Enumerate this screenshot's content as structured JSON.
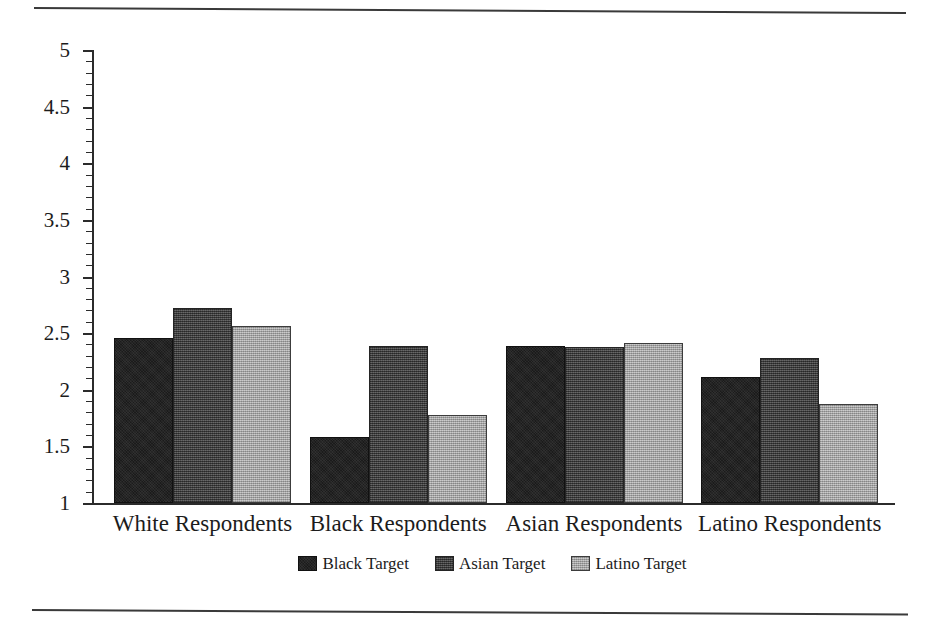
{
  "chart_data": {
    "type": "bar",
    "title": "",
    "subtitle": "",
    "xlabel": "",
    "ylabel": "",
    "ylim": [
      1,
      5
    ],
    "ytick_labels": [
      "1",
      "1.5",
      "2",
      "2.5",
      "3",
      "3.5",
      "4",
      "4.5",
      "5"
    ],
    "ytick_values": [
      1,
      1.5,
      2,
      2.5,
      3,
      3.5,
      4,
      4.5,
      5
    ],
    "minor_tick_step": 0.1,
    "grid": false,
    "legend_position": "bottom-center",
    "categories": [
      "White Respondents",
      "Black Respondents",
      "Asian Respondents",
      "Latino Respondents"
    ],
    "series": [
      {
        "name": "Black Target",
        "color": "#1b1b1b",
        "values": [
          2.46,
          1.58,
          2.39,
          2.11
        ]
      },
      {
        "name": "Asian Target",
        "color": "#4c4c4c",
        "values": [
          2.72,
          2.39,
          2.38,
          2.28
        ]
      },
      {
        "name": "Latino Target",
        "color": "#b2b2b2",
        "values": [
          2.56,
          1.78,
          2.41,
          1.87
        ]
      }
    ]
  },
  "figure": {
    "top_rule": "horizontal-rule",
    "bottom_rule": "horizontal-rule"
  }
}
